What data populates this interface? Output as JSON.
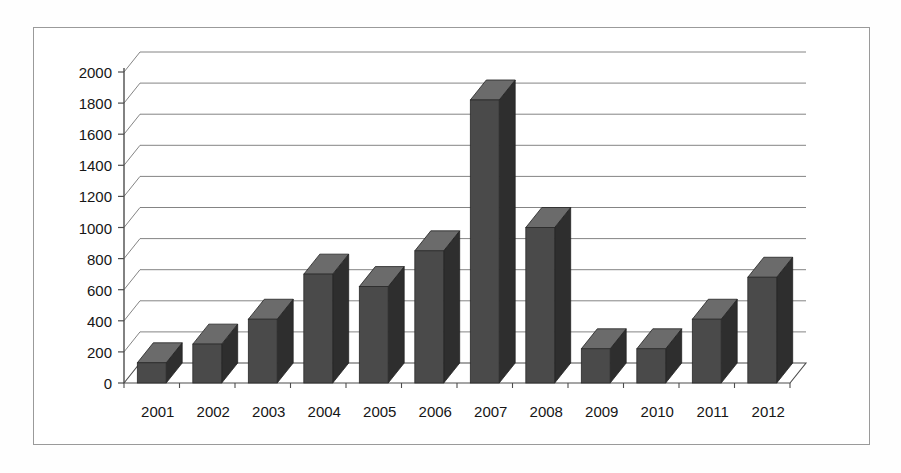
{
  "chart_data": {
    "type": "bar",
    "title": "",
    "subtitle": "",
    "xlabel": "",
    "ylabel": "",
    "categories": [
      "2001",
      "2002",
      "2003",
      "2004",
      "2005",
      "2006",
      "2007",
      "2008",
      "2009",
      "2010",
      "2011",
      "2012"
    ],
    "values": [
      130,
      250,
      410,
      700,
      620,
      850,
      1820,
      1000,
      220,
      220,
      410,
      680
    ],
    "series": [
      {
        "name": "Series 1",
        "values": [
          130,
          250,
          410,
          700,
          620,
          850,
          1820,
          1000,
          220,
          220,
          410,
          680
        ]
      }
    ],
    "ylim": [
      0,
      2000
    ],
    "yticks": [
      0,
      200,
      400,
      600,
      800,
      1000,
      1200,
      1400,
      1600,
      1800,
      2000
    ],
    "ytick_labels": [
      "0",
      "200",
      "400",
      "600",
      "800",
      "1000",
      "1200",
      "1400",
      "1600",
      "1800",
      "2000"
    ],
    "grid": true,
    "grid_axis": "y",
    "legend": false,
    "legend_position": "none",
    "three_d": true,
    "annotations": []
  },
  "style": {
    "bar_face_color": "#4a4a4a",
    "bar_side_color": "#2e2e2e",
    "bar_top_color": "#6b6b6b",
    "grid_color": "#6e6e6e",
    "axis_color": "#4d4d4d",
    "border_color": "#9a9a9a",
    "background_color": "#ffffff",
    "text_color": "#161616"
  }
}
